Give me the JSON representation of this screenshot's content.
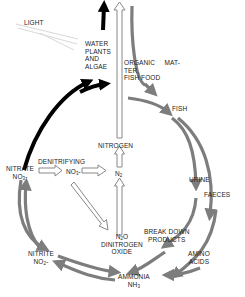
{
  "diagram": {
    "colors": {
      "gray_arrow": "#7d7d7d",
      "black_arrow": "#000000",
      "hollow_arrow_stroke": "#888888",
      "light_ray": "#d8d8d8",
      "text": "#222222"
    },
    "nodes": {
      "light": "LIGHT",
      "water_plants": [
        "WATER",
        "PLANTS",
        "AND",
        "ALGAE"
      ],
      "organic_matter": [
        "ORGANIC     MAT-",
        "TER,",
        "FISH FOOD"
      ],
      "fish": "FISH",
      "urine": "URINE",
      "faeces": "FAECES",
      "break_down": [
        "BREAK DOWN",
        "PRODUCTS"
      ],
      "amino_acids": [
        "AMINO",
        "ACIDS"
      ],
      "ammonia": "AMMONIA",
      "ammonia_formula": {
        "base": "NH",
        "sub": "3"
      },
      "nitrite": "NITRITE",
      "nitrite_formula": {
        "base": "NO",
        "sub": "2",
        "suffix": "-"
      },
      "nitrate": "NITRATE",
      "nitrate_formula": {
        "base": "NO",
        "sub": "3",
        "suffix": "-"
      },
      "denitrifying": "DENITRIFYING",
      "denit_formula": {
        "base": "NO",
        "sub": "3",
        "suffix": "-"
      },
      "n2_formula": {
        "base": "N",
        "sub": "2"
      },
      "nitrogen": "NITROGEN",
      "n2o_formula": {
        "base": "N",
        "sub": "2",
        "suffix": "O"
      },
      "dinitrogen_oxide": [
        "DINITROGEN",
        "OXIDE"
      ]
    },
    "edges": [
      {
        "from": "light",
        "to": "water_plants",
        "style": "light-rays"
      },
      {
        "from": "nitrate",
        "to": "water_plants",
        "style": "black"
      },
      {
        "from": "nitrate",
        "to": "fish",
        "style": "black"
      },
      {
        "from": "water_plants",
        "to": "out",
        "style": "black"
      },
      {
        "from": "organic_matter",
        "to": "fish",
        "style": "gray"
      },
      {
        "from": "fish",
        "to": "urine",
        "style": "gray"
      },
      {
        "from": "fish",
        "to": "faeces",
        "style": "gray"
      },
      {
        "from": "urine",
        "to": "ammonia",
        "style": "gray"
      },
      {
        "from": "faeces",
        "to": "ammonia",
        "style": "gray"
      },
      {
        "from": "ammonia",
        "to": "nitrite",
        "style": "gray"
      },
      {
        "from": "nitrite",
        "to": "ammonia",
        "style": "gray"
      },
      {
        "from": "nitrite",
        "to": "nitrate",
        "style": "gray"
      },
      {
        "from": "nitrate",
        "to": "nitrite",
        "style": "gray"
      },
      {
        "from": "nitrate",
        "to": "denitrifying",
        "style": "hollow"
      },
      {
        "from": "denitrifying",
        "to": "n2",
        "style": "hollow"
      },
      {
        "from": "denitrifying",
        "to": "n2o",
        "style": "hollow"
      },
      {
        "from": "n2o",
        "to": "n2",
        "style": "hollow"
      },
      {
        "from": "n2",
        "to": "nitrogen",
        "style": "hollow"
      },
      {
        "from": "nitrogen",
        "to": "out",
        "style": "hollow"
      }
    ]
  }
}
